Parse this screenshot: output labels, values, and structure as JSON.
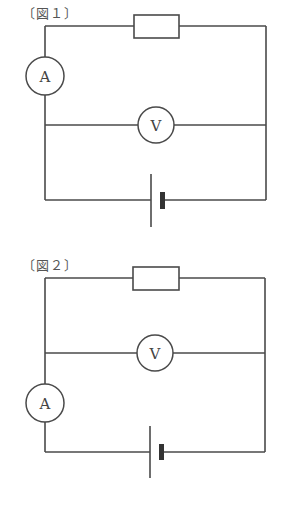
{
  "figures": [
    {
      "label": "〔図１〕",
      "ammeter_symbol": "A",
      "voltmeter_symbol": "V",
      "components": [
        "resistor",
        "ammeter",
        "voltmeter",
        "battery"
      ],
      "ammeter_position": "left wire, above voltmeter branch"
    },
    {
      "label": "〔図２〕",
      "ammeter_symbol": "A",
      "voltmeter_symbol": "V",
      "components": [
        "resistor",
        "ammeter",
        "voltmeter",
        "battery"
      ],
      "ammeter_position": "left wire, below voltmeter branch"
    }
  ],
  "colors": {
    "line": "#4a4a4a",
    "background": "#ffffff"
  }
}
